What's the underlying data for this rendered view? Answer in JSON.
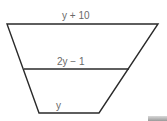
{
  "diagram": {
    "type": "trapezoid-with-midsegment",
    "labels": {
      "top_base": "y + 10",
      "midsegment": "2y − 1",
      "bottom_base": "y"
    },
    "colors": {
      "stroke": "#2a2a2a",
      "label": "#6a6a6a",
      "background": "#ffffff"
    },
    "geometry": {
      "top": {
        "x1": 7,
        "x2": 158,
        "y": 24
      },
      "middle": {
        "x1": 24,
        "x2": 129,
        "y": 69
      },
      "bottom": {
        "x1": 39,
        "x2": 99,
        "y": 113
      }
    }
  }
}
